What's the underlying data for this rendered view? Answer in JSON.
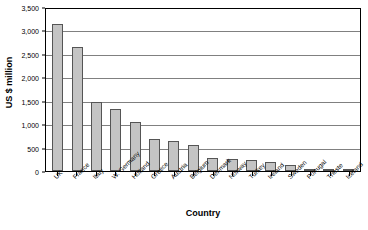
{
  "chart_data": {
    "type": "bar",
    "title": "",
    "xlabel": "Country",
    "ylabel": "US $ million",
    "ylim": [
      0,
      3500
    ],
    "ytick_step": 500,
    "ytick_labels": [
      "0",
      "500",
      "1,000",
      "1,500",
      "2,000",
      "2,500",
      "3,000",
      "3,500"
    ],
    "ytick_values": [
      0,
      500,
      1000,
      1500,
      2000,
      2500,
      3000,
      3500
    ],
    "grid": true,
    "legend": false,
    "legend_position": "none",
    "bar_fill_color": "#c4c4c4",
    "bar_border_color": "#555555",
    "plot_border_color": "#000000",
    "gridline_color": "#808080",
    "categories": [
      "UK",
      "France",
      "Italy",
      "W. Germany",
      "Holland",
      "Greece",
      "Austria",
      "Belgium",
      "Denmark",
      "Norway",
      "Turkey",
      "Ireland",
      "Sweden",
      "Portugal",
      "Trieste",
      "Iceland"
    ],
    "values": [
      3180,
      2690,
      1500,
      1340,
      1060,
      700,
      650,
      560,
      290,
      270,
      240,
      195,
      135,
      50,
      35,
      35
    ]
  }
}
